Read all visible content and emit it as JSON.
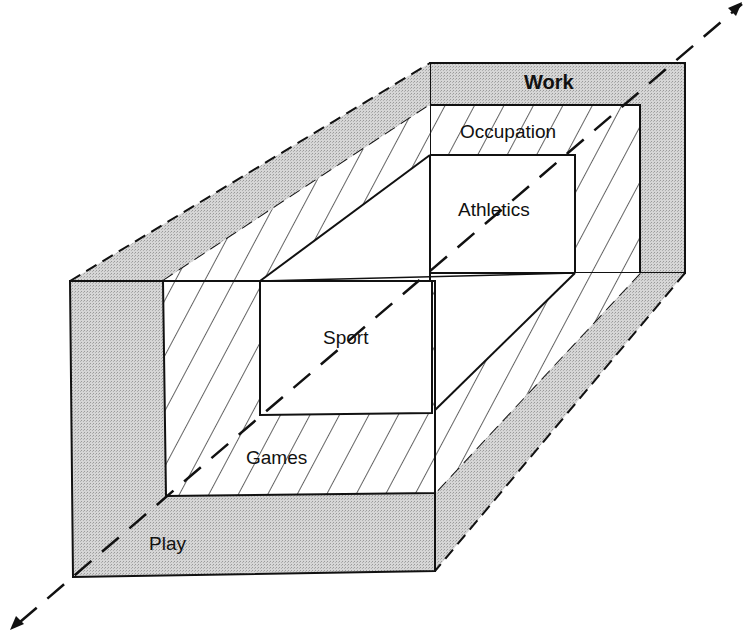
{
  "diagram": {
    "type": "nested-3d-box-continuum",
    "axis": {
      "style": "dashed",
      "direction": "bidirectional",
      "from": "Play",
      "to": "Work"
    },
    "layers": [
      {
        "id": "outer",
        "front_label": "Play",
        "back_label": "Work",
        "fill": "stippled-gray"
      },
      {
        "id": "middle",
        "front_label": "Games",
        "back_label": "Occupation",
        "fill": "diagonal-hatch"
      },
      {
        "id": "inner",
        "front_label": "Sport",
        "back_label": "Athletics",
        "fill": "white"
      }
    ],
    "labels": {
      "work": "Work",
      "occupation": "Occupation",
      "athletics": "Athletics",
      "sport": "Sport",
      "games": "Games",
      "play": "Play"
    },
    "colors": {
      "stipple": "#cfcfcf",
      "line": "#111111",
      "background": "#ffffff"
    }
  }
}
